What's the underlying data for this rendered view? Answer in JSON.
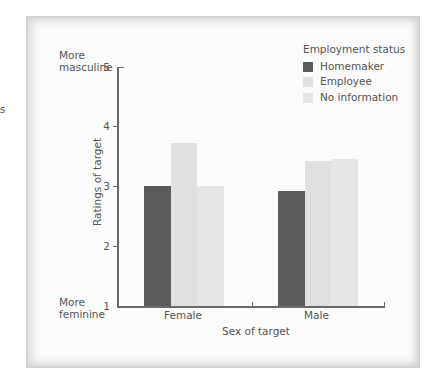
{
  "stray_text": "s",
  "chart_data": {
    "type": "bar",
    "title": "",
    "xlabel": "Sex of target",
    "ylabel": "Ratings of target",
    "ylim": [
      1,
      5
    ],
    "yticks": [
      1,
      2,
      3,
      4,
      5
    ],
    "y_annotations": {
      "top": "More masculine",
      "bottom": "More feminine"
    },
    "categories": [
      "Female",
      "Male"
    ],
    "legend_title": "Employment status",
    "legend_position": "top-right",
    "grid": false,
    "series": [
      {
        "name": "Homemaker",
        "color": "#5b5b5b",
        "values": [
          3.0,
          2.92
        ]
      },
      {
        "name": "Employee",
        "color": "#e0e0e0",
        "values": [
          3.73,
          3.42
        ]
      },
      {
        "name": "No information",
        "color": "#e6e6e6",
        "values": [
          3.0,
          3.46
        ]
      }
    ]
  },
  "labels": {
    "top_annotation_line1": "More",
    "top_annotation_line2": "masculine",
    "bottom_annotation_line1": "More",
    "bottom_annotation_line2": "feminine",
    "tick_5": "5",
    "tick_4": "4",
    "tick_3": "3",
    "tick_2": "2",
    "tick_1": "1",
    "cat_female": "Female",
    "cat_male": "Male",
    "legend_item_0": "Homemaker",
    "legend_item_1": "Employee",
    "legend_item_2": "No information"
  }
}
